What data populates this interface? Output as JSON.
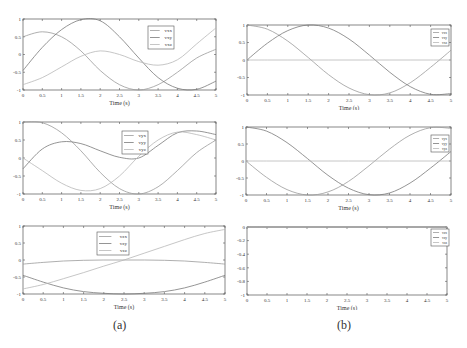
{
  "captions": {
    "a": "(a)",
    "b": "(b)"
  },
  "colors": {
    "axis": "#555555",
    "line1": "#9a9a9a",
    "line2": "#7a7a7a",
    "line3": "#b8b8b8"
  },
  "chart_data": [
    {
      "id": "a1",
      "type": "line",
      "title": "",
      "xlabel": "Time (s)",
      "ylabel": "",
      "xlim": [
        0,
        5
      ],
      "ylim": [
        -1,
        1
      ],
      "xticks": [
        "0",
        "0.5",
        "1",
        "1.5",
        "2",
        "2.5",
        "3",
        "3.5",
        "4",
        "4.5",
        "5"
      ],
      "yticks": [
        "1",
        "0.5",
        "0",
        "-0.5",
        "-1"
      ],
      "legend": [
        "vxx",
        "vxy",
        "vxz"
      ],
      "legend_position": "upper-right-inner",
      "x": [
        0,
        0.5,
        1,
        1.5,
        2,
        2.5,
        3,
        3.5,
        4,
        4.5,
        5
      ],
      "series": [
        {
          "name": "vxx",
          "values": [
            0.5,
            0.64,
            0.5,
            0.1,
            -0.45,
            -0.85,
            -1.0,
            -0.85,
            -0.5,
            -0.1,
            0.15
          ]
        },
        {
          "name": "vxy",
          "values": [
            -0.45,
            0.2,
            0.7,
            0.98,
            0.95,
            0.5,
            -0.1,
            -0.65,
            -0.95,
            -0.98,
            -0.75
          ]
        },
        {
          "name": "vxz",
          "values": [
            -0.85,
            -0.65,
            -0.35,
            -0.05,
            0.1,
            0.0,
            -0.2,
            -0.3,
            -0.15,
            0.3,
            0.75
          ]
        }
      ]
    },
    {
      "id": "a2",
      "type": "line",
      "title": "",
      "xlabel": "Time (s)",
      "ylabel": "",
      "xlim": [
        0,
        5
      ],
      "ylim": [
        -1,
        1
      ],
      "xticks": [
        "0",
        "0.5",
        "1",
        "1.5",
        "2",
        "2.5",
        "3",
        "3.5",
        "4",
        "4.5",
        "5"
      ],
      "yticks": [
        "1",
        "0.5",
        "0",
        "-0.5",
        "-1"
      ],
      "legend": [
        "vyx",
        "vyy",
        "vyz"
      ],
      "legend_position": "upper-center-inner",
      "x": [
        0,
        0.5,
        1,
        1.5,
        2,
        2.5,
        3,
        3.5,
        4,
        4.5,
        5
      ],
      "series": [
        {
          "name": "vyx",
          "values": [
            1.0,
            0.98,
            0.7,
            0.2,
            -0.4,
            -0.85,
            -1.0,
            -0.8,
            -0.35,
            0.15,
            0.5
          ]
        },
        {
          "name": "vyy",
          "values": [
            -0.3,
            0.25,
            0.45,
            0.4,
            0.2,
            0.02,
            0.0,
            0.35,
            0.7,
            0.75,
            0.65
          ]
        },
        {
          "name": "vyz",
          "values": [
            0.0,
            -0.35,
            -0.7,
            -0.9,
            -0.85,
            -0.5,
            0.05,
            0.5,
            0.72,
            0.65,
            0.5
          ]
        }
      ]
    },
    {
      "id": "a3",
      "type": "line",
      "title": "",
      "xlabel": "Time (s)",
      "ylabel": "",
      "xlim": [
        0,
        5
      ],
      "ylim": [
        -1,
        1
      ],
      "xticks": [
        "0",
        "0.5",
        "1",
        "1.5",
        "2",
        "2.5",
        "3",
        "3.5",
        "4",
        "4.5",
        "5"
      ],
      "yticks": [
        "1",
        "0.5",
        "0",
        "-0.5",
        "-1"
      ],
      "legend": [
        "vzx",
        "vzy",
        "vzz"
      ],
      "legend_position": "upper-center-inner",
      "x": [
        0,
        0.5,
        1,
        1.5,
        2,
        2.5,
        3,
        3.5,
        4,
        4.5,
        5
      ],
      "series": [
        {
          "name": "vzx",
          "values": [
            -0.12,
            -0.07,
            -0.03,
            -0.01,
            0.0,
            0.0,
            0.0,
            -0.01,
            -0.03,
            -0.07,
            -0.12
          ]
        },
        {
          "name": "vzy",
          "values": [
            -0.45,
            -0.65,
            -0.82,
            -0.93,
            -0.98,
            -1.0,
            -0.98,
            -0.93,
            -0.82,
            -0.65,
            -0.45
          ]
        },
        {
          "name": "vzz",
          "values": [
            -0.85,
            -0.72,
            -0.55,
            -0.37,
            -0.18,
            0.0,
            0.2,
            0.4,
            0.6,
            0.78,
            0.9
          ]
        }
      ]
    },
    {
      "id": "b1",
      "type": "line",
      "title": "",
      "xlabel": "Time (s)",
      "ylabel": "",
      "xlim": [
        0,
        5
      ],
      "ylim": [
        -1,
        1
      ],
      "xticks": [
        "0",
        "0.5",
        "1",
        "1.5",
        "2",
        "2.5",
        "3",
        "3.5",
        "4",
        "4.5",
        "5"
      ],
      "yticks": [
        "1",
        "0.5",
        "0",
        "-0.5",
        "-1"
      ],
      "legend": [
        "vxx",
        "vxy",
        "vxz"
      ],
      "legend_position": "upper-right-inner",
      "x": [
        0,
        0.5,
        1,
        1.5,
        2,
        2.5,
        3,
        3.5,
        4,
        4.5,
        5
      ],
      "series": [
        {
          "name": "vxx",
          "values": [
            1.0,
            0.88,
            0.54,
            0.07,
            -0.42,
            -0.8,
            -0.99,
            -0.94,
            -0.65,
            -0.21,
            0.28
          ]
        },
        {
          "name": "vxy",
          "values": [
            0.0,
            0.48,
            0.84,
            1.0,
            0.91,
            0.6,
            0.14,
            -0.35,
            -0.76,
            -0.98,
            -0.96
          ]
        },
        {
          "name": "vxz",
          "values": [
            0,
            0,
            0,
            0,
            0,
            0,
            0,
            0,
            0,
            0,
            0
          ]
        }
      ]
    },
    {
      "id": "b2",
      "type": "line",
      "title": "",
      "xlabel": "Time (s)",
      "ylabel": "",
      "xlim": [
        0,
        5
      ],
      "ylim": [
        -1,
        1
      ],
      "xticks": [
        "0",
        "0.5",
        "1",
        "1.5",
        "2",
        "2.5",
        "3",
        "3.5",
        "4",
        "4.5",
        "5"
      ],
      "yticks": [
        "1",
        "0.5",
        "0",
        "-0.5",
        "-1"
      ],
      "legend": [
        "vyx",
        "vyy",
        "vyz"
      ],
      "legend_position": "upper-right-inner",
      "x": [
        0,
        0.5,
        1,
        1.5,
        2,
        2.5,
        3,
        3.5,
        4,
        4.5,
        5
      ],
      "series": [
        {
          "name": "vyx",
          "values": [
            0.0,
            -0.48,
            -0.84,
            -1.0,
            -0.91,
            -0.6,
            -0.14,
            0.35,
            0.76,
            0.98,
            0.96
          ]
        },
        {
          "name": "vyy",
          "values": [
            1.0,
            0.88,
            0.54,
            0.07,
            -0.42,
            -0.8,
            -0.99,
            -0.94,
            -0.65,
            -0.21,
            0.28
          ]
        },
        {
          "name": "vyz",
          "values": [
            0,
            0,
            0,
            0,
            0,
            0,
            0,
            0,
            0,
            0,
            0
          ]
        }
      ]
    },
    {
      "id": "b3",
      "type": "line",
      "title": "",
      "xlabel": "Time (s)",
      "ylabel": "",
      "xlim": [
        0,
        5
      ],
      "ylim": [
        -1,
        0
      ],
      "xticks": [
        "0",
        "0.5",
        "1",
        "1.5",
        "2",
        "2.5",
        "3",
        "3.5",
        "4",
        "4.5",
        "5"
      ],
      "yticks": [
        "0",
        "-0.2",
        "-0.4",
        "-0.6",
        "-0.8",
        "-1"
      ],
      "legend": [
        "vzx",
        "vzy",
        "vzz"
      ],
      "legend_position": "upper-right-inner",
      "x": [
        0,
        0.5,
        1,
        1.5,
        2,
        2.5,
        3,
        3.5,
        4,
        4.5,
        5
      ],
      "series": [
        {
          "name": "vzx",
          "values": [
            0,
            0,
            0,
            0,
            0,
            0,
            0,
            0,
            0,
            0,
            0
          ]
        },
        {
          "name": "vzy",
          "values": [
            0,
            0,
            0,
            0,
            0,
            0,
            0,
            0,
            0,
            0,
            0
          ]
        },
        {
          "name": "vzz",
          "values": [
            0,
            0,
            0,
            0,
            0,
            0,
            0,
            0,
            0,
            0,
            0
          ]
        }
      ]
    }
  ]
}
